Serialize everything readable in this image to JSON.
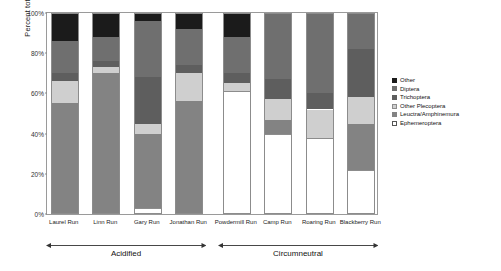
{
  "chart_data": {
    "type": "bar",
    "stacked": true,
    "title": "",
    "xlabel": "",
    "ylabel": "Percent total",
    "ylim": [
      0,
      100
    ],
    "ytick_labels": [
      "0%",
      "20%",
      "40%",
      "60%",
      "80%",
      "100%"
    ],
    "ytick_values": [
      0,
      20,
      40,
      60,
      80,
      100
    ],
    "grid": false,
    "legend_position": "right",
    "categories": [
      "Laurel Run",
      "Linn Run",
      "Gary Run",
      "Jonathan Run",
      "Powdermill Run",
      "Camp Run",
      "Roaring Run",
      "Blackberry Run"
    ],
    "series": [
      {
        "name": "Ephemeroptera",
        "color": "#ffffff",
        "values": [
          0,
          0,
          3,
          0,
          61,
          40,
          38,
          22
        ]
      },
      {
        "name": "Leuctra/Amphinemura",
        "color": "#838383",
        "values": [
          55,
          70,
          37,
          56,
          0,
          7,
          0,
          23
        ]
      },
      {
        "name": "Other Plecoptera",
        "color": "#cfcfcf",
        "values": [
          11,
          3,
          5,
          14,
          4,
          10,
          14,
          13
        ]
      },
      {
        "name": "Trichoptera",
        "color": "#5e5e5e",
        "values": [
          4,
          3,
          23,
          4,
          5,
          10,
          8,
          24
        ]
      },
      {
        "name": "Diptera",
        "color": "#6f6f6f",
        "values": [
          16,
          12,
          28,
          18,
          18,
          33,
          40,
          18
        ]
      },
      {
        "name": "Other",
        "color": "#1b1b1b",
        "values": [
          14,
          12,
          4,
          8,
          12,
          0,
          0,
          0
        ]
      }
    ],
    "groups": [
      {
        "label": "Acidified",
        "members": [
          "Laurel Run",
          "Linn Run",
          "Gary Run",
          "Jonathan Run"
        ]
      },
      {
        "label": "Circumneutral",
        "members": [
          "Powdermill Run",
          "Camp Run",
          "Roaring Run",
          "Blackberry Run"
        ]
      }
    ]
  },
  "legend": {
    "entries": [
      {
        "label": "Other",
        "swatch": "swatch-other"
      },
      {
        "label": "Diptera",
        "swatch": "swatch-diptera"
      },
      {
        "label": "Trichoptera",
        "swatch": "swatch-trichoptera"
      },
      {
        "label": "Other Plecoptera",
        "swatch": "swatch-other-plecoptera"
      },
      {
        "label": "Leuctra/Amphinemura",
        "swatch": "swatch-leuctra-amphinemura"
      },
      {
        "label": "Ephemeroptera",
        "swatch": "swatch-ephemeroptera"
      }
    ]
  }
}
